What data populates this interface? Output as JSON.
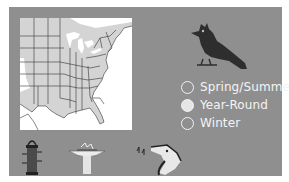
{
  "range_map": {
    "region": "Eastern United States",
    "colors": {
      "panel_bg": "#8f8f8f",
      "map_bg": "#ffffff",
      "range_fill": "#c8c8c8",
      "land_fill": "#d8d8d8",
      "borders": "#333333"
    }
  },
  "bird": {
    "icon": "crested-bird-silhouette",
    "color": "#2e2e2e"
  },
  "legend": {
    "items": [
      {
        "label": "Spring/Summer",
        "swatch": "#8f8f8f"
      },
      {
        "label": "Year-Round",
        "swatch": "#e6e6e6"
      },
      {
        "label": "Winter",
        "swatch": "#8f8f8f"
      }
    ]
  },
  "habitat_icons": [
    {
      "name": "tube-feeder-icon"
    },
    {
      "name": "birdbath-icon"
    },
    {
      "name": "singing-bird-head-icon"
    }
  ]
}
